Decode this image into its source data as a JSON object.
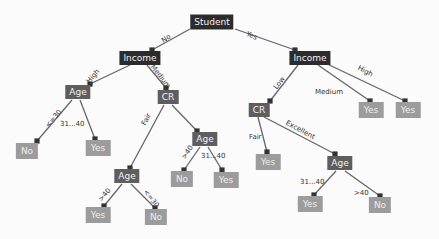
{
  "colors": {
    "internal_dark": "#2c2c2c",
    "internal_mid": "#5e5e5e",
    "leaf": "#9c9c9c",
    "edge": "#555555"
  },
  "nodes": {
    "root": {
      "label": "Student"
    },
    "income_no": {
      "label": "Income"
    },
    "income_yes": {
      "label": "Income"
    },
    "age_high": {
      "label": "Age"
    },
    "cr_medium": {
      "label": "CR"
    },
    "leaf_no_le30": {
      "label": "No"
    },
    "leaf_yes_31_40": {
      "label": "Yes"
    },
    "age_fair": {
      "label": "Age"
    },
    "leaf_yes_gt40_fair": {
      "label": "Yes"
    },
    "leaf_no_le30_fair": {
      "label": "No"
    },
    "age_medium_branch": {
      "label": "Age"
    },
    "leaf_no_gt40_mid": {
      "label": "No"
    },
    "leaf_yes_31_40_mid": {
      "label": "Yes"
    },
    "cr_low": {
      "label": "CR"
    },
    "leaf_yes_medium": {
      "label": "Yes"
    },
    "leaf_yes_high": {
      "label": "Yes"
    },
    "leaf_yes_cr_fair": {
      "label": "Yes"
    },
    "age_excellent": {
      "label": "Age"
    },
    "leaf_yes_exc_31_40": {
      "label": "Yes"
    },
    "leaf_no_exc_gt40": {
      "label": "No"
    }
  },
  "edges": {
    "no": "No",
    "yes": "Yes",
    "high_l": "High",
    "medium_l": "Medium",
    "le30": "<=30",
    "r31_40": "31...40",
    "fair_l": "Fair",
    "gt40_l": ">40",
    "le30_l": "<=30",
    "gt40_mid": ">40",
    "r31_40_mid": "31...40",
    "low_r": "Low",
    "medium_r": "Medium",
    "high_r": "High",
    "fair_r": "Fair",
    "excellent_r": "Excellent",
    "r31_40_r": "31...40",
    "gt40_r": ">40"
  }
}
